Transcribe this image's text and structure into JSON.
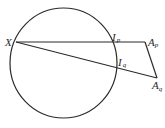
{
  "diagram": {
    "type": "geometry",
    "circle": {
      "cx": 63.5,
      "cy": 63,
      "rx": 53.5,
      "ry": 55,
      "stroke": "#2a2a2a"
    },
    "points": {
      "X": {
        "x": 16,
        "y": 42,
        "label": "X",
        "sub": ""
      },
      "Ip": {
        "x": 112,
        "y": 42,
        "label": "I",
        "sub": "p"
      },
      "Ap": {
        "x": 145,
        "y": 42,
        "label": "A",
        "sub": "p"
      },
      "Iq": {
        "x": 116,
        "y": 68,
        "label": "I",
        "sub": "q"
      },
      "Aq": {
        "x": 157,
        "y": 78,
        "label": "A",
        "sub": "q"
      }
    },
    "segments": [
      {
        "from": "X",
        "to": "Ap"
      },
      {
        "from": "X",
        "to": "Aq"
      },
      {
        "from": "Ap",
        "to": "Aq"
      }
    ],
    "labels": {
      "X": "X",
      "Ip": "I",
      "Ip_sub": "p",
      "Ap": "A",
      "Ap_sub": "p",
      "Iq": "I",
      "Iq_sub": "q",
      "Aq": "A",
      "Aq_sub": "q"
    }
  }
}
